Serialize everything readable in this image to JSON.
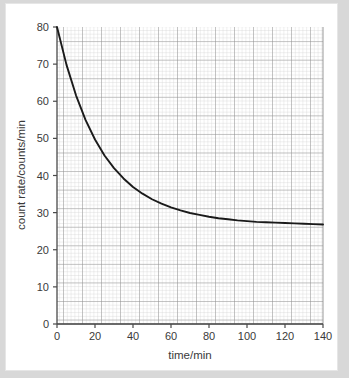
{
  "chart_data": {
    "type": "line",
    "title": "",
    "xlabel": "time/min",
    "ylabel": "count rate/counts/min",
    "xlim": [
      0,
      140
    ],
    "ylim": [
      0,
      80
    ],
    "xticks": [
      0,
      20,
      40,
      60,
      80,
      100,
      120,
      140
    ],
    "yticks": [
      0,
      10,
      20,
      30,
      40,
      50,
      60,
      70,
      80
    ],
    "grid": "minor-and-major",
    "legend": "none",
    "asymptote": 25,
    "series": [
      {
        "name": "count rate",
        "color": "#1a1a1a",
        "x": [
          0,
          5,
          10,
          15,
          20,
          25,
          30,
          35,
          40,
          45,
          50,
          55,
          60,
          65,
          70,
          75,
          80,
          85,
          90,
          95,
          100,
          105,
          110,
          115,
          120,
          125,
          130,
          135,
          140
        ],
        "y": [
          80.0,
          69.8,
          61.6,
          55.0,
          49.7,
          45.4,
          42.0,
          39.2,
          36.9,
          35.1,
          33.6,
          32.4,
          31.4,
          30.6,
          29.9,
          29.4,
          28.9,
          28.5,
          28.2,
          27.9,
          27.7,
          27.5,
          27.4,
          27.3,
          27.2,
          27.1,
          27.0,
          26.9,
          26.8
        ]
      }
    ]
  },
  "axes": {
    "x_tick_labels": [
      "0",
      "20",
      "40",
      "60",
      "80",
      "100",
      "120",
      "140"
    ],
    "y_tick_labels": [
      "0",
      "10",
      "20",
      "30",
      "40",
      "50",
      "60",
      "70",
      "80"
    ],
    "x_axis_title": "time/min",
    "y_axis_title": "count rate/counts/min"
  },
  "colors": {
    "page_background": "#d8d8d8",
    "card_background": "#ffffff",
    "curve": "#1a1a1a",
    "grid_minor": "#c9c9c9",
    "grid_major": "#9a9a9a",
    "axis": "#4a4a4a",
    "text": "#3a3a3a"
  }
}
